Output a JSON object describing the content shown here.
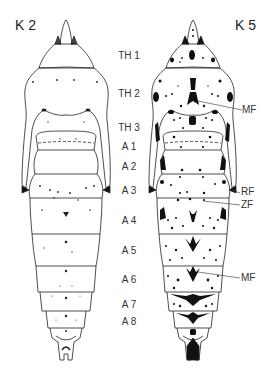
{
  "figure": {
    "left_title": "K 2",
    "right_title": "K 5",
    "segments": [
      {
        "label": "TH 1",
        "y": 51
      },
      {
        "label": "TH 2",
        "y": 89
      },
      {
        "label": "TH 3",
        "y": 123
      },
      {
        "label": "A 1",
        "y": 142
      },
      {
        "label": "A 2",
        "y": 162
      },
      {
        "label": "A 3",
        "y": 186
      },
      {
        "label": "A 4",
        "y": 216
      },
      {
        "label": "A 5",
        "y": 246
      },
      {
        "label": "A 6",
        "y": 275
      },
      {
        "label": "A 7",
        "y": 300
      },
      {
        "label": "A 8",
        "y": 317
      }
    ],
    "annotations": [
      {
        "label": "MF",
        "target": "mid-field thorax"
      },
      {
        "label": "RF",
        "target": "margin field A3"
      },
      {
        "label": "ZF",
        "target": "center field A3"
      },
      {
        "label": "MF",
        "target": "mid-field A6"
      }
    ],
    "colors": {
      "line": "#222222",
      "background": "#ffffff"
    }
  }
}
